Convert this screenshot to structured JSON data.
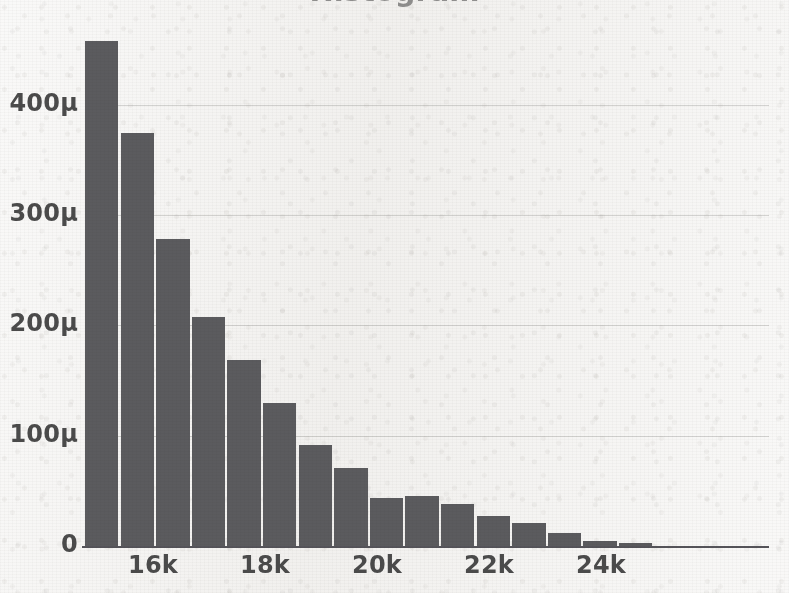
{
  "title": "Histogram",
  "chart_data": {
    "type": "bar",
    "title": "Histogram",
    "xlabel": "",
    "ylabel": "",
    "grid": true,
    "legend": null,
    "xlim": [
      14800,
      24600
    ],
    "ylim": [
      0,
      460
    ],
    "y_unit": "µ",
    "y_ticks": [
      0,
      100,
      200,
      300,
      400
    ],
    "y_tick_labels": [
      "0",
      "100µ",
      "200µ",
      "300µ",
      "400µ"
    ],
    "x_ticks": [
      16000,
      18000,
      20000,
      22000,
      24000
    ],
    "x_tick_labels": [
      "16k",
      "18k",
      "20k",
      "22k",
      "24k"
    ],
    "bin_width": 636,
    "categories": [
      "15158",
      "15794",
      "16430",
      "17066",
      "17702",
      "18338",
      "18974",
      "19610",
      "20246",
      "20882",
      "21518",
      "22154",
      "22790",
      "23426",
      "24062",
      "24698",
      "25334",
      "25970",
      "26606"
    ],
    "values": [
      458,
      374,
      278,
      208,
      169,
      130,
      92,
      71,
      44,
      45,
      38,
      27,
      21,
      12,
      5,
      3,
      0,
      0,
      0
    ],
    "bar_color": "#5b5b5e",
    "background_color": "#f3f2f0",
    "gridline_color": "#78767233",
    "axis_color": "#55545a"
  }
}
